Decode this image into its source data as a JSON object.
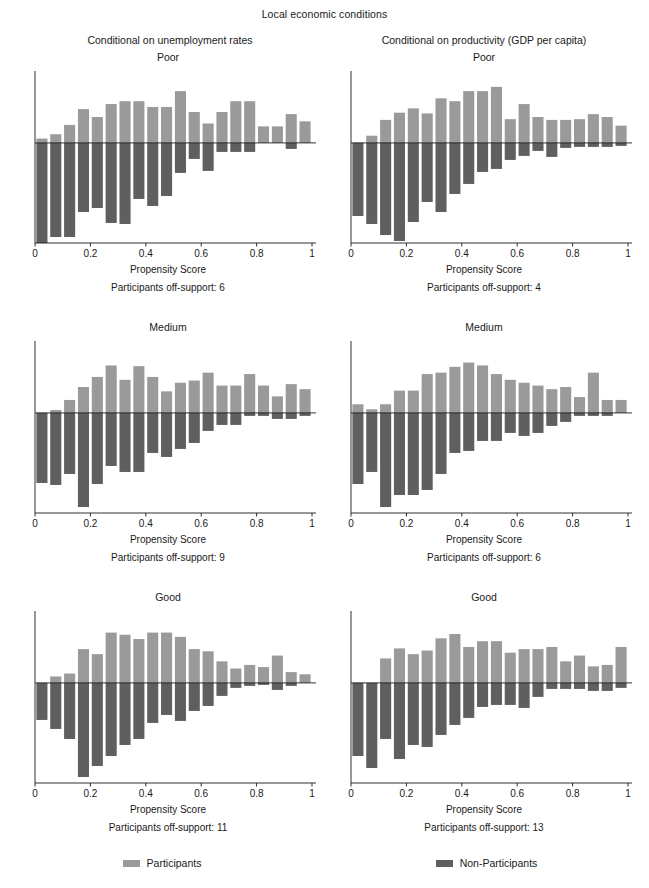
{
  "figure": {
    "supertitle": "Local economic conditions",
    "column_titles": [
      "Conditional on unemployment rates",
      "Conditional on productivity (GDP per capita)"
    ],
    "xlabel": "Propensity Score",
    "colors": {
      "participants": "#9a9a9a",
      "non_participants": "#5f5f5f",
      "axis": "#1a1a1a"
    },
    "legend": [
      {
        "label": "Participants",
        "color": "#9a9a9a"
      },
      {
        "label": "Non-Participants",
        "color": "#5f5f5f"
      }
    ]
  },
  "panels": [
    {
      "id": "unemployment-poor",
      "title": "Poor",
      "offsupport_label": "Participants off-support: 6",
      "offsupport_count": 6
    },
    {
      "id": "productivity-poor",
      "title": "Poor",
      "offsupport_label": "Participants off-support: 4",
      "offsupport_count": 4
    },
    {
      "id": "unemployment-medium",
      "title": "Medium",
      "offsupport_label": "Participants off-support: 9",
      "offsupport_count": 9
    },
    {
      "id": "productivity-medium",
      "title": "Medium",
      "offsupport_label": "Participants off-support: 6",
      "offsupport_count": 6
    },
    {
      "id": "unemployment-good",
      "title": "Good",
      "offsupport_label": "Participants off-support: 11",
      "offsupport_count": 11
    },
    {
      "id": "productivity-good",
      "title": "Good",
      "offsupport_label": "Participants off-support: 13",
      "offsupport_count": 13
    }
  ],
  "chart_data": [
    {
      "type": "bar",
      "title": "Poor",
      "panel": "Conditional on unemployment rates",
      "xlabel": "Propensity Score",
      "ylabel": "",
      "orientation": "back-to-back histogram",
      "grid": false,
      "xlim": [
        0,
        1
      ],
      "xticks": [
        0,
        0.2,
        0.4,
        0.6,
        0.8,
        1
      ],
      "xticklabels": [
        "0",
        "0.2",
        "0.4",
        "0.6",
        "0.8",
        "1"
      ],
      "ylim": [
        -1.0,
        0.72
      ],
      "bin_centers": [
        0.025,
        0.075,
        0.125,
        0.175,
        0.225,
        0.275,
        0.325,
        0.375,
        0.425,
        0.475,
        0.525,
        0.575,
        0.625,
        0.675,
        0.725,
        0.775,
        0.825,
        0.875,
        0.925,
        0.975
      ],
      "series": [
        {
          "name": "Participants",
          "direction": "up",
          "color": "#9a9a9a",
          "values": [
            0.06,
            0.12,
            0.25,
            0.47,
            0.36,
            0.54,
            0.58,
            0.58,
            0.5,
            0.5,
            0.72,
            0.43,
            0.27,
            0.43,
            0.58,
            0.58,
            0.23,
            0.23,
            0.4,
            0.3
          ]
        },
        {
          "name": "Non-Participants",
          "direction": "down",
          "color": "#5f5f5f",
          "values": [
            1.0,
            0.94,
            0.94,
            0.69,
            0.65,
            0.8,
            0.81,
            0.56,
            0.63,
            0.53,
            0.3,
            0.16,
            0.28,
            0.09,
            0.09,
            0.09,
            0.0,
            0.0,
            0.06,
            0.0
          ]
        }
      ]
    },
    {
      "type": "bar",
      "title": "Poor",
      "panel": "Conditional on productivity (GDP per capita)",
      "xlabel": "Propensity Score",
      "ylabel": "",
      "orientation": "back-to-back histogram",
      "grid": false,
      "xlim": [
        0,
        1
      ],
      "xticks": [
        0,
        0.2,
        0.4,
        0.6,
        0.8,
        1
      ],
      "xticklabels": [
        "0",
        "0.2",
        "0.4",
        "0.6",
        "0.8",
        "1"
      ],
      "ylim": [
        -1.0,
        0.72
      ],
      "bin_centers": [
        0.025,
        0.075,
        0.125,
        0.175,
        0.225,
        0.275,
        0.325,
        0.375,
        0.425,
        0.475,
        0.525,
        0.575,
        0.625,
        0.675,
        0.725,
        0.775,
        0.825,
        0.875,
        0.925,
        0.975
      ],
      "series": [
        {
          "name": "Participants",
          "direction": "up",
          "color": "#9a9a9a",
          "values": [
            0.0,
            0.1,
            0.32,
            0.42,
            0.48,
            0.41,
            0.62,
            0.58,
            0.72,
            0.72,
            0.78,
            0.33,
            0.54,
            0.36,
            0.32,
            0.32,
            0.33,
            0.4,
            0.36,
            0.24
          ]
        },
        {
          "name": "Non-Participants",
          "direction": "down",
          "color": "#5f5f5f",
          "values": [
            0.73,
            0.81,
            0.92,
            0.98,
            0.79,
            0.59,
            0.69,
            0.51,
            0.41,
            0.29,
            0.26,
            0.17,
            0.13,
            0.08,
            0.14,
            0.05,
            0.04,
            0.04,
            0.04,
            0.03
          ]
        }
      ]
    },
    {
      "type": "bar",
      "title": "Medium",
      "panel": "Conditional on unemployment rates",
      "xlabel": "Propensity Score",
      "ylabel": "",
      "orientation": "back-to-back histogram",
      "grid": false,
      "xlim": [
        0,
        1
      ],
      "xticks": [
        0,
        0.2,
        0.4,
        0.6,
        0.8,
        1
      ],
      "xticklabels": [
        "0",
        "0.2",
        "0.4",
        "0.6",
        "0.8",
        "1"
      ],
      "ylim": [
        -1.0,
        0.72
      ],
      "bin_centers": [
        0.025,
        0.075,
        0.125,
        0.175,
        0.225,
        0.275,
        0.325,
        0.375,
        0.425,
        0.475,
        0.525,
        0.575,
        0.625,
        0.675,
        0.725,
        0.775,
        0.825,
        0.875,
        0.925,
        0.975
      ],
      "series": [
        {
          "name": "Participants",
          "direction": "up",
          "color": "#9a9a9a",
          "values": [
            0.0,
            0.04,
            0.18,
            0.36,
            0.5,
            0.66,
            0.46,
            0.65,
            0.5,
            0.3,
            0.42,
            0.45,
            0.56,
            0.38,
            0.38,
            0.54,
            0.38,
            0.23,
            0.4,
            0.33
          ]
        },
        {
          "name": "Non-Participants",
          "direction": "down",
          "color": "#5f5f5f",
          "values": [
            0.7,
            0.72,
            0.61,
            0.94,
            0.71,
            0.53,
            0.59,
            0.59,
            0.4,
            0.44,
            0.36,
            0.3,
            0.18,
            0.12,
            0.12,
            0.03,
            0.03,
            0.06,
            0.06,
            0.03
          ]
        }
      ]
    },
    {
      "type": "bar",
      "title": "Medium",
      "panel": "Conditional on productivity (GDP per capita)",
      "xlabel": "Propensity Score",
      "ylabel": "",
      "orientation": "back-to-back histogram",
      "grid": false,
      "xlim": [
        0,
        1
      ],
      "xticks": [
        0,
        0.2,
        0.4,
        0.6,
        0.8,
        1
      ],
      "xticklabels": [
        "0",
        "0.2",
        "0.4",
        "0.6",
        "0.8",
        "1"
      ],
      "ylim": [
        -1.0,
        0.72
      ],
      "bin_centers": [
        0.025,
        0.075,
        0.125,
        0.175,
        0.225,
        0.275,
        0.325,
        0.375,
        0.425,
        0.475,
        0.525,
        0.575,
        0.625,
        0.675,
        0.725,
        0.775,
        0.825,
        0.875,
        0.925,
        0.975
      ],
      "series": [
        {
          "name": "Participants",
          "direction": "up",
          "color": "#9a9a9a",
          "values": [
            0.12,
            0.05,
            0.12,
            0.31,
            0.31,
            0.54,
            0.56,
            0.64,
            0.7,
            0.66,
            0.54,
            0.46,
            0.42,
            0.38,
            0.33,
            0.36,
            0.22,
            0.56,
            0.18,
            0.18
          ]
        },
        {
          "name": "Non-Participants",
          "direction": "down",
          "color": "#5f5f5f",
          "values": [
            0.71,
            0.59,
            0.94,
            0.82,
            0.82,
            0.77,
            0.61,
            0.4,
            0.38,
            0.28,
            0.28,
            0.2,
            0.23,
            0.2,
            0.13,
            0.09,
            0.03,
            0.03,
            0.03,
            0.0
          ]
        }
      ]
    },
    {
      "type": "bar",
      "title": "Good",
      "panel": "Conditional on unemployment rates",
      "xlabel": "Propensity Score",
      "ylabel": "",
      "orientation": "back-to-back histogram",
      "grid": false,
      "xlim": [
        0,
        1
      ],
      "xticks": [
        0,
        0.2,
        0.4,
        0.6,
        0.8,
        1
      ],
      "xticklabels": [
        "0",
        "0.2",
        "0.4",
        "0.6",
        "0.8",
        "1"
      ],
      "ylim": [
        -1.0,
        0.72
      ],
      "bin_centers": [
        0.025,
        0.075,
        0.125,
        0.175,
        0.225,
        0.275,
        0.325,
        0.375,
        0.425,
        0.475,
        0.525,
        0.575,
        0.625,
        0.675,
        0.725,
        0.775,
        0.825,
        0.875,
        0.925,
        0.975
      ],
      "series": [
        {
          "name": "Participants",
          "direction": "up",
          "color": "#9a9a9a",
          "values": [
            0.0,
            0.09,
            0.13,
            0.47,
            0.4,
            0.7,
            0.67,
            0.61,
            0.7,
            0.7,
            0.64,
            0.47,
            0.44,
            0.3,
            0.2,
            0.25,
            0.22,
            0.38,
            0.15,
            0.12
          ]
        },
        {
          "name": "Non-Participants",
          "direction": "down",
          "color": "#5f5f5f",
          "values": [
            0.37,
            0.46,
            0.56,
            0.94,
            0.83,
            0.73,
            0.62,
            0.56,
            0.4,
            0.32,
            0.38,
            0.28,
            0.23,
            0.13,
            0.05,
            0.03,
            0.02,
            0.07,
            0.03,
            0.0
          ]
        }
      ]
    },
    {
      "type": "bar",
      "title": "Good",
      "panel": "Conditional on productivity (GDP per capita)",
      "xlabel": "Propensity Score",
      "ylabel": "",
      "orientation": "back-to-back histogram",
      "grid": false,
      "xlim": [
        0,
        1
      ],
      "xticks": [
        0,
        0.2,
        0.4,
        0.6,
        0.8,
        1
      ],
      "xticklabels": [
        "0",
        "0.2",
        "0.4",
        "0.6",
        "0.8",
        "1"
      ],
      "ylim": [
        -1.0,
        0.72
      ],
      "bin_centers": [
        0.025,
        0.075,
        0.125,
        0.175,
        0.225,
        0.275,
        0.325,
        0.375,
        0.425,
        0.475,
        0.525,
        0.575,
        0.625,
        0.675,
        0.725,
        0.775,
        0.825,
        0.875,
        0.925,
        0.975
      ],
      "series": [
        {
          "name": "Participants",
          "direction": "up",
          "color": "#9a9a9a",
          "values": [
            0.0,
            0.0,
            0.34,
            0.48,
            0.4,
            0.45,
            0.62,
            0.68,
            0.5,
            0.58,
            0.58,
            0.42,
            0.47,
            0.47,
            0.5,
            0.3,
            0.38,
            0.23,
            0.25,
            0.5
          ]
        },
        {
          "name": "Non-Participants",
          "direction": "down",
          "color": "#5f5f5f",
          "values": [
            0.73,
            0.85,
            0.56,
            0.76,
            0.62,
            0.64,
            0.52,
            0.42,
            0.35,
            0.24,
            0.22,
            0.22,
            0.25,
            0.14,
            0.06,
            0.06,
            0.06,
            0.08,
            0.08,
            0.05
          ]
        }
      ]
    }
  ]
}
